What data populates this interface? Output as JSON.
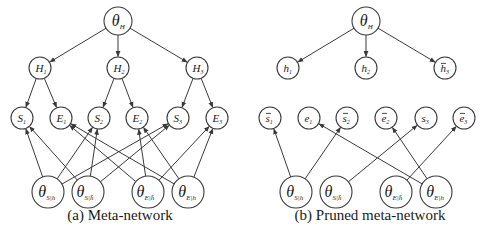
{
  "panels": [
    {
      "id": "a",
      "caption": "(a) Meta-network",
      "caption_pos": [
        120,
        220
      ],
      "nodes": [
        {
          "id": "thetaH",
          "main": "θ",
          "sub": "H",
          "bar": false,
          "x": 118,
          "y": 21,
          "r": 14,
          "size": 16
        },
        {
          "id": "H1",
          "main": "H",
          "sub": "1",
          "bar": false,
          "x": 40,
          "y": 68,
          "r": 11,
          "size": 11
        },
        {
          "id": "H2",
          "main": "H",
          "sub": "2",
          "bar": false,
          "x": 118,
          "y": 68,
          "r": 11,
          "size": 11
        },
        {
          "id": "H3",
          "main": "H",
          "sub": "3",
          "bar": false,
          "x": 197,
          "y": 68,
          "r": 11,
          "size": 11
        },
        {
          "id": "S1",
          "main": "S",
          "sub": "1",
          "bar": false,
          "x": 22,
          "y": 118,
          "r": 11,
          "size": 11
        },
        {
          "id": "E1",
          "main": "E",
          "sub": "1",
          "bar": false,
          "x": 61,
          "y": 118,
          "r": 11,
          "size": 11
        },
        {
          "id": "S2",
          "main": "S",
          "sub": "2",
          "bar": false,
          "x": 99,
          "y": 118,
          "r": 11,
          "size": 11
        },
        {
          "id": "E2",
          "main": "E",
          "sub": "2",
          "bar": false,
          "x": 137,
          "y": 118,
          "r": 11,
          "size": 11
        },
        {
          "id": "S3",
          "main": "S",
          "sub": "3",
          "bar": false,
          "x": 178,
          "y": 118,
          "r": 11,
          "size": 11
        },
        {
          "id": "E3",
          "main": "E",
          "sub": "3",
          "bar": false,
          "x": 217,
          "y": 118,
          "r": 11,
          "size": 11
        },
        {
          "id": "tSh",
          "main": "θ",
          "sub": "S|h",
          "bar": false,
          "x": 48,
          "y": 192,
          "r": 16,
          "size": 16
        },
        {
          "id": "tShb",
          "main": "θ",
          "sub": "S|h̄",
          "bar": false,
          "x": 88,
          "y": 192,
          "r": 16,
          "size": 16
        },
        {
          "id": "tEhb",
          "main": "θ",
          "sub": "E|h̄",
          "bar": false,
          "x": 148,
          "y": 192,
          "r": 16,
          "size": 16
        },
        {
          "id": "tEh",
          "main": "θ",
          "sub": "E|h",
          "bar": false,
          "x": 188,
          "y": 192,
          "r": 16,
          "size": 16
        }
      ],
      "edges": [
        [
          "thetaH",
          "H1"
        ],
        [
          "thetaH",
          "H2"
        ],
        [
          "thetaH",
          "H3"
        ],
        [
          "H1",
          "S1"
        ],
        [
          "H1",
          "E1"
        ],
        [
          "H2",
          "S2"
        ],
        [
          "H2",
          "E2"
        ],
        [
          "H3",
          "S3"
        ],
        [
          "H3",
          "E3"
        ],
        [
          "tSh",
          "S1"
        ],
        [
          "tSh",
          "S2"
        ],
        [
          "tSh",
          "S3"
        ],
        [
          "tShb",
          "S1"
        ],
        [
          "tShb",
          "S2"
        ],
        [
          "tShb",
          "S3"
        ],
        [
          "tEhb",
          "E1"
        ],
        [
          "tEhb",
          "E2"
        ],
        [
          "tEhb",
          "E3"
        ],
        [
          "tEh",
          "E1"
        ],
        [
          "tEh",
          "E2"
        ],
        [
          "tEh",
          "E3"
        ]
      ]
    },
    {
      "id": "b",
      "caption": "(b) Pruned meta-network",
      "caption_pos": [
        370,
        220
      ],
      "nodes": [
        {
          "id": "thetaH",
          "main": "θ",
          "sub": "H",
          "bar": false,
          "x": 366,
          "y": 21,
          "r": 14,
          "size": 16
        },
        {
          "id": "h1",
          "main": "h",
          "sub": "1",
          "bar": false,
          "x": 288,
          "y": 68,
          "r": 11,
          "size": 11
        },
        {
          "id": "h2",
          "main": "h",
          "sub": "2",
          "bar": false,
          "x": 366,
          "y": 68,
          "r": 11,
          "size": 11
        },
        {
          "id": "h3",
          "main": "h",
          "sub": "3",
          "bar": true,
          "x": 445,
          "y": 68,
          "r": 11,
          "size": 11
        },
        {
          "id": "s1",
          "main": "s",
          "sub": "1",
          "bar": true,
          "x": 270,
          "y": 118,
          "r": 11,
          "size": 11
        },
        {
          "id": "e1",
          "main": "e",
          "sub": "1",
          "bar": false,
          "x": 309,
          "y": 118,
          "r": 11,
          "size": 11
        },
        {
          "id": "s2",
          "main": "s",
          "sub": "2",
          "bar": true,
          "x": 347,
          "y": 118,
          "r": 11,
          "size": 11
        },
        {
          "id": "e2",
          "main": "e",
          "sub": "2",
          "bar": true,
          "x": 386,
          "y": 118,
          "r": 11,
          "size": 11
        },
        {
          "id": "s3",
          "main": "s",
          "sub": "3",
          "bar": false,
          "x": 426,
          "y": 118,
          "r": 11,
          "size": 11
        },
        {
          "id": "e3",
          "main": "e",
          "sub": "3",
          "bar": true,
          "x": 464,
          "y": 118,
          "r": 11,
          "size": 11
        },
        {
          "id": "tSh",
          "main": "θ",
          "sub": "S|h",
          "bar": false,
          "x": 296,
          "y": 192,
          "r": 16,
          "size": 16
        },
        {
          "id": "tShb",
          "main": "θ",
          "sub": "S|h̄",
          "bar": false,
          "x": 336,
          "y": 192,
          "r": 16,
          "size": 16
        },
        {
          "id": "tEhb",
          "main": "θ",
          "sub": "E|h̄",
          "bar": false,
          "x": 396,
          "y": 192,
          "r": 16,
          "size": 16
        },
        {
          "id": "tEh",
          "main": "θ",
          "sub": "E|h",
          "bar": false,
          "x": 436,
          "y": 192,
          "r": 16,
          "size": 16
        }
      ],
      "edges": [
        [
          "thetaH",
          "h1"
        ],
        [
          "thetaH",
          "h2"
        ],
        [
          "thetaH",
          "h3"
        ],
        [
          "tSh",
          "s1"
        ],
        [
          "tSh",
          "s2"
        ],
        [
          "tShb",
          "s3"
        ],
        [
          "tEhb",
          "e3"
        ],
        [
          "tEh",
          "e1"
        ],
        [
          "tEh",
          "e2"
        ]
      ]
    }
  ],
  "colors": {
    "stroke": "#3a3a3a",
    "text": "#1a1a1a",
    "background": "#ffffff"
  }
}
